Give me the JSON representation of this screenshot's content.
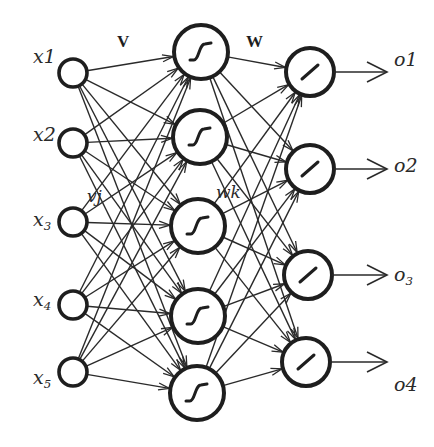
{
  "diagram": {
    "title": "",
    "type": "feedforward-neural-network",
    "colors": {
      "background": "#ffffff",
      "stroke": "#1e1e1e",
      "edge": "#2a2a2a"
    },
    "layers": [
      {
        "name": "input",
        "activation": "none",
        "nodes": [
          {
            "id": "x1",
            "label": "x1",
            "sub": "",
            "cx": 73,
            "cy": 73,
            "r": 14
          },
          {
            "id": "x2",
            "label": "x2",
            "sub": "",
            "cx": 73,
            "cy": 143,
            "r": 14
          },
          {
            "id": "x3",
            "label": "x",
            "sub": "3",
            "cx": 73,
            "cy": 222,
            "r": 14
          },
          {
            "id": "x4",
            "label": "x",
            "sub": "4",
            "cx": 73,
            "cy": 305,
            "r": 14
          },
          {
            "id": "x5",
            "label": "x",
            "sub": "5",
            "cx": 73,
            "cy": 372,
            "r": 14
          }
        ]
      },
      {
        "name": "hidden",
        "activation": "sigmoid-icon",
        "nodes": [
          {
            "id": "h1",
            "cx": 201,
            "cy": 52,
            "r": 27
          },
          {
            "id": "h2",
            "cx": 200,
            "cy": 137,
            "r": 27
          },
          {
            "id": "h3",
            "cx": 198,
            "cy": 226,
            "r": 27
          },
          {
            "id": "h4",
            "cx": 198,
            "cy": 316,
            "r": 27
          },
          {
            "id": "h5",
            "cx": 197,
            "cy": 393,
            "r": 27
          }
        ]
      },
      {
        "name": "output",
        "activation": "linear-icon",
        "nodes": [
          {
            "id": "o1",
            "label": "o1",
            "sub": "",
            "cx": 310,
            "cy": 72,
            "r": 24
          },
          {
            "id": "o2",
            "label": "o2",
            "sub": "",
            "cx": 310,
            "cy": 169,
            "r": 24
          },
          {
            "id": "o3",
            "label": "o",
            "sub": "3",
            "cx": 308,
            "cy": 275,
            "r": 24
          },
          {
            "id": "o4",
            "label": "o4",
            "sub": "",
            "cx": 306,
            "cy": 362,
            "r": 24
          }
        ]
      }
    ],
    "weight_labels": {
      "V": {
        "text": "V",
        "x": 117,
        "y": 47
      },
      "W": {
        "text": "W",
        "x": 246,
        "y": 47
      },
      "vj": {
        "text": "vj",
        "x": 87,
        "y": 202
      },
      "wk": {
        "text": "wk",
        "x": 216,
        "y": 198
      }
    },
    "input_labels": [
      {
        "text": "x1",
        "sub": "",
        "x": 33,
        "y": 63
      },
      {
        "text": "x2",
        "sub": "",
        "x": 33,
        "y": 141
      },
      {
        "text": "x",
        "sub": "3",
        "x": 33,
        "y": 226
      },
      {
        "text": "x",
        "sub": "4",
        "x": 33,
        "y": 306
      },
      {
        "text": "x",
        "sub": "5",
        "x": 33,
        "y": 384
      }
    ],
    "output_labels": [
      {
        "text": "o1",
        "sub": "",
        "x": 394,
        "y": 66
      },
      {
        "text": "o2",
        "sub": "",
        "x": 394,
        "y": 172
      },
      {
        "text": "o",
        "sub": "3",
        "x": 394,
        "y": 281
      },
      {
        "text": "o4",
        "sub": "",
        "x": 394,
        "y": 391
      }
    ],
    "output_arrow_end_x": 387,
    "connectivity": "fully-connected"
  }
}
